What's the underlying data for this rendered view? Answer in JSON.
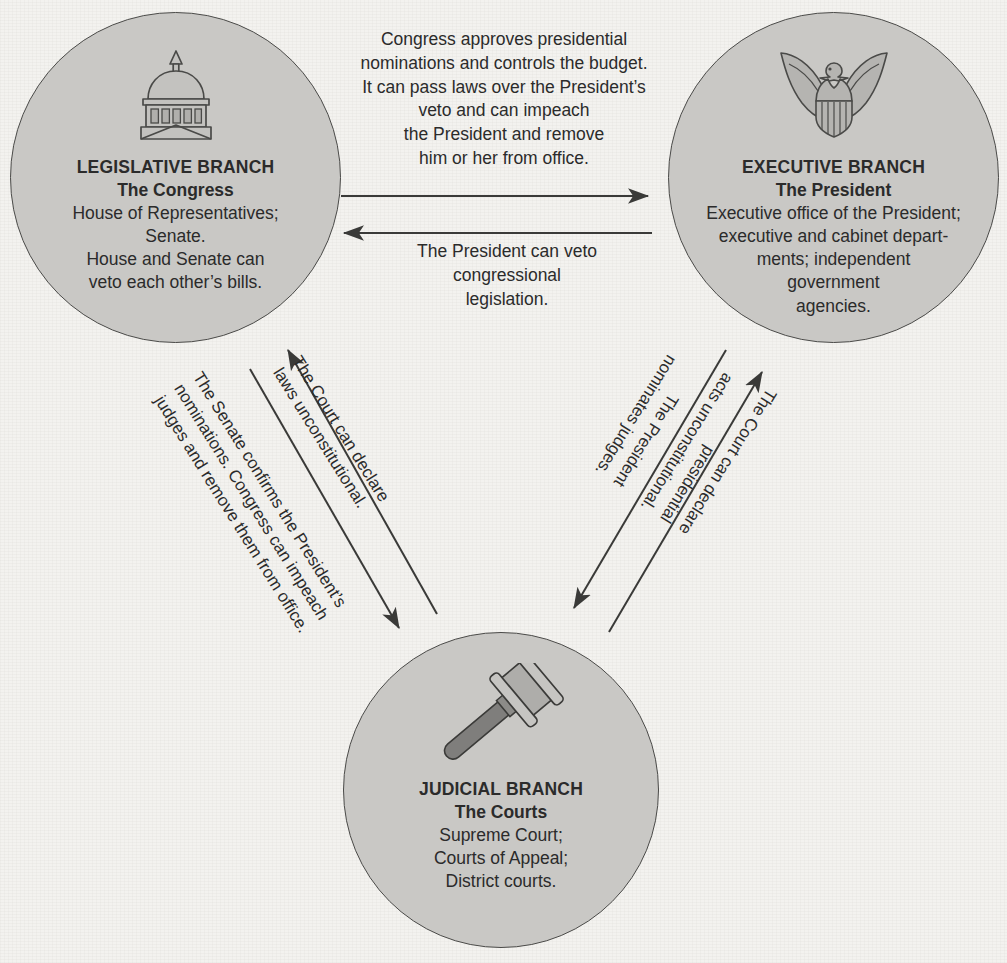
{
  "diagram": {
    "background_color": "#f3f2ef",
    "node_fill_color": "#c9c8c5",
    "node_stroke_color": "#4a4a48",
    "text_color": "#2b2b2b",
    "arrow_color": "#3a3a38"
  },
  "nodes": {
    "legislative": {
      "icon": "capitol-dome-icon",
      "title": "LEGISLATIVE BRANCH",
      "subtitle": "The Congress",
      "description": "House of Representatives;\nSenate.\nHouse and Senate can\nveto each other’s bills."
    },
    "executive": {
      "icon": "eagle-shield-icon",
      "title": "EXECUTIVE BRANCH",
      "subtitle": "The President",
      "description": "Executive office of the President;\nexecutive and cabinet depart-\nments; independent\ngovernment\nagencies."
    },
    "judicial": {
      "icon": "gavel-icon",
      "title": "JUDICIAL BRANCH",
      "subtitle": "The Courts",
      "description": "Supreme Court;\nCourts of Appeal;\nDistrict courts."
    }
  },
  "connections": {
    "legislative_to_executive": {
      "from": "LEGISLATIVE BRANCH",
      "to": "EXECUTIVE BRANCH",
      "direction": "right",
      "label": "Congress approves presidential\nnominations and controls the budget.\nIt can pass laws over the President’s\nveto and can impeach\nthe President and remove\nhim or her from office."
    },
    "executive_to_legislative": {
      "from": "EXECUTIVE BRANCH",
      "to": "LEGISLATIVE BRANCH",
      "direction": "left",
      "label": "The President can veto\ncongressional\nlegislation."
    },
    "judicial_to_legislative": {
      "from": "JUDICIAL BRANCH",
      "to": "LEGISLATIVE BRANCH",
      "direction": "up-left",
      "label": "The Court can declare\nlaws unconstitutional."
    },
    "legislative_to_judicial": {
      "from": "LEGISLATIVE BRANCH",
      "to": "JUDICIAL BRANCH",
      "direction": "down-right",
      "label": "The Senate confirms the President’s\nnominations. Congress can impeach\njudges and remove them from office."
    },
    "executive_to_judicial": {
      "from": "EXECUTIVE BRANCH",
      "to": "JUDICIAL BRANCH",
      "direction": "down-left",
      "label": "The President\nnominates judges."
    },
    "judicial_to_executive": {
      "from": "JUDICIAL BRANCH",
      "to": "EXECUTIVE BRANCH",
      "direction": "up-right",
      "label": "The Court can declare\npresidential\nacts unconstitutional."
    }
  }
}
